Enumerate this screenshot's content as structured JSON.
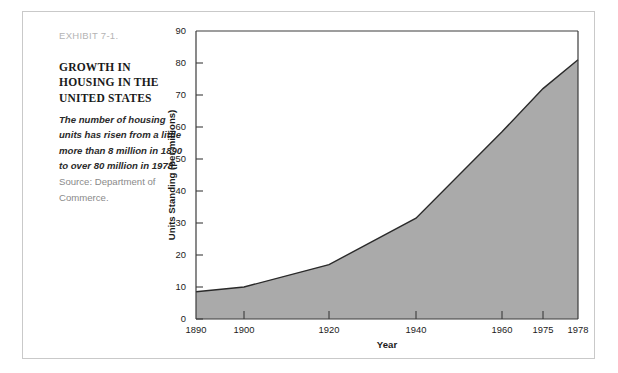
{
  "exhibit": {
    "label": "EXHIBIT 7-1.",
    "title": "GROWTH IN HOUSING IN THE UNITED STATES",
    "description": "The number of housing units has risen from a little more than 8 million in 1890 to over 80 million in 1978.",
    "source": "Source: Department of Commerce."
  },
  "colors": {
    "area_fill": "#aaaaaa",
    "curve_line": "#2a2a2a",
    "axis": "#3c3c3c",
    "frame_border": "#c9c9c9",
    "label_gray": "#b4b4b4"
  },
  "chart_data": {
    "type": "area",
    "title": "",
    "xlabel": "Year",
    "ylabel": "Units Standing (per millions)",
    "x": [
      1890,
      1900,
      1920,
      1940,
      1960,
      1975,
      1978
    ],
    "values": [
      8.5,
      10,
      17,
      31.5,
      58.5,
      72,
      81
    ],
    "x_tick_labels": [
      "1890",
      "1900",
      "1920",
      "1940",
      "1960",
      "1975",
      "1978"
    ],
    "y_tick_labels": [
      "0",
      "10",
      "20",
      "30",
      "40",
      "50",
      "60",
      "70",
      "80",
      "90"
    ],
    "y_ticks": [
      0,
      10,
      20,
      30,
      40,
      50,
      60,
      70,
      80,
      90
    ],
    "ylim": [
      0,
      90
    ],
    "grid": false,
    "legend": "none",
    "axis_note": "x axis spacing is non-linear; ticks placed at drawn positions"
  }
}
